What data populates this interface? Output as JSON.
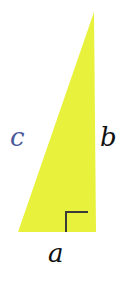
{
  "diagram": {
    "type": "right-triangle",
    "fill_color": "#e8f23c",
    "marker_color": "#3a3a3a",
    "vertices": {
      "top": [
        94,
        12
      ],
      "bottom_right": [
        96,
        232
      ],
      "bottom_left": [
        18,
        232
      ]
    },
    "right_angle_marker": {
      "corner": [
        66,
        212
      ],
      "size": 22
    },
    "labels": {
      "hypotenuse": {
        "text": "c",
        "color": "#4a5a9a"
      },
      "vertical_leg": {
        "text": "b",
        "color": "#111111"
      },
      "horizontal_leg": {
        "text": "a",
        "color": "#111111"
      }
    }
  }
}
